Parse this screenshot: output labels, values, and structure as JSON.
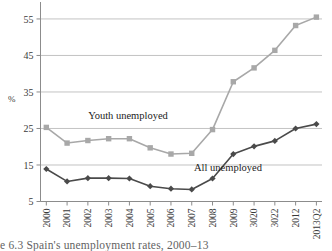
{
  "figure": {
    "caption": "e 6.3  Spain's unemployment rates, 2000–13",
    "y_axis_unit": "%"
  },
  "chart_data": {
    "type": "line",
    "title": "",
    "xlabel": "",
    "ylabel": "%",
    "ylim": [
      5,
      58
    ],
    "yticks": [
      5,
      15,
      25,
      35,
      45,
      55
    ],
    "ytick_labels": [
      "5",
      "15",
      "25",
      "35",
      "45",
      "55"
    ],
    "grid": true,
    "grid_axis": "y",
    "legend": "inline-annotations",
    "categories": [
      "2000",
      "2001",
      "2002",
      "2003",
      "2004",
      "2005",
      "2006",
      "2007",
      "2008",
      "2009",
      "3020",
      "3022",
      "2012",
      "2013Q2"
    ],
    "series": [
      {
        "name": "Youth unemployed",
        "color": "#a8a8a8",
        "marker": "square",
        "values": [
          25.3,
          21.0,
          21.7,
          22.2,
          22.2,
          19.7,
          18.0,
          18.2,
          24.7,
          37.8,
          41.6,
          46.4,
          53.2,
          55.5
        ]
      },
      {
        "name": "All unemployed",
        "color": "#4a4a4a",
        "marker": "diamond",
        "values": [
          13.9,
          10.5,
          11.4,
          11.4,
          11.3,
          9.2,
          8.5,
          8.3,
          11.3,
          18.0,
          20.1,
          21.6,
          25.0,
          26.2
        ]
      }
    ],
    "annotations": [
      {
        "text": "Youth unemployed",
        "x": 128,
        "y": 119
      },
      {
        "text": "All unemployed",
        "x": 228,
        "y": 171
      }
    ]
  }
}
